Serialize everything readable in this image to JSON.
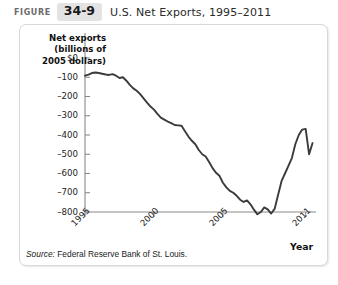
{
  "header": {
    "figure_word": "FIGURE",
    "figure_number": "34-9",
    "title": "U.S. Net Exports, 1995–2011"
  },
  "source": {
    "label": "Source:",
    "text": " Federal Reserve Bank of St. Louis."
  },
  "colors": {
    "line": "#3b3b3b",
    "axis": "#8a8a8a",
    "panel_border": "#d8d8d8",
    "figure_badge_bg": "#e3e3e3",
    "text": "#222222"
  },
  "chart_data": {
    "type": "line",
    "title": "U.S. Net Exports, 1995–2011",
    "ylabel": "Net exports (billions of 2005 dollars)",
    "ylabel_lines": [
      "Net exports",
      "(billions of",
      "2005 dollars)"
    ],
    "xlabel": "Year",
    "ylim": [
      -850,
      40
    ],
    "xlim": [
      1995,
      2011.75
    ],
    "grid": false,
    "legend": null,
    "y_ticks": [
      0,
      -100,
      -200,
      -300,
      -400,
      -500,
      -600,
      -700,
      -800
    ],
    "y_tick_labels": [
      "$0",
      "–100",
      "–200",
      "–300",
      "–400",
      "–500",
      "–600",
      "–700",
      "–800"
    ],
    "x_ticks": [
      1995,
      2000,
      2005,
      2011
    ],
    "x_tick_labels": [
      "1995",
      "2000",
      "2005",
      "2011"
    ],
    "series": [
      {
        "name": "U.S. Net Exports",
        "x": [
          1995.0,
          1995.25,
          1995.5,
          1995.75,
          1996.0,
          1996.25,
          1996.5,
          1996.75,
          1997.0,
          1997.25,
          1997.5,
          1997.75,
          1998.0,
          1998.25,
          1998.5,
          1998.75,
          1999.0,
          1999.25,
          1999.5,
          1999.75,
          2000.0,
          2000.25,
          2000.5,
          2000.75,
          2001.0,
          2001.25,
          2001.5,
          2001.75,
          2002.0,
          2002.25,
          2002.5,
          2002.75,
          2003.0,
          2003.25,
          2003.5,
          2003.75,
          2004.0,
          2004.25,
          2004.5,
          2004.75,
          2005.0,
          2005.25,
          2005.5,
          2005.75,
          2006.0,
          2006.25,
          2006.5,
          2006.75,
          2007.0,
          2007.25,
          2007.5,
          2007.75,
          2008.0,
          2008.25,
          2008.5,
          2008.75,
          2009.0,
          2009.25,
          2009.5,
          2009.75,
          2010.0,
          2010.25,
          2010.5,
          2010.75,
          2011.0,
          2011.25,
          2011.5
        ],
        "values": [
          -92,
          -86,
          -78,
          -75,
          -78,
          -82,
          -86,
          -88,
          -84,
          -92,
          -104,
          -100,
          -118,
          -140,
          -158,
          -170,
          -188,
          -210,
          -232,
          -252,
          -268,
          -290,
          -310,
          -320,
          -330,
          -338,
          -348,
          -350,
          -352,
          -380,
          -408,
          -430,
          -448,
          -478,
          -500,
          -512,
          -540,
          -572,
          -596,
          -612,
          -648,
          -672,
          -690,
          -700,
          -716,
          -736,
          -748,
          -740,
          -760,
          -788,
          -812,
          -800,
          -776,
          -786,
          -808,
          -784,
          -712,
          -640,
          -600,
          -560,
          -520,
          -448,
          -400,
          -372,
          -368,
          -500,
          -442
        ]
      }
    ],
    "annotations": []
  }
}
